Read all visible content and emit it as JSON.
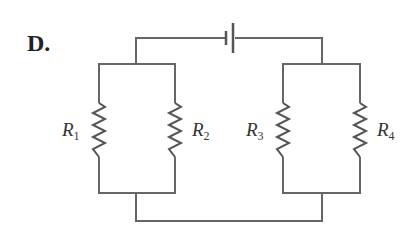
{
  "diagram": {
    "option_label": "D.",
    "type": "circuit",
    "components": {
      "battery": {
        "symbol": "cell",
        "position": "top wire"
      },
      "resistors": [
        {
          "name": "R",
          "sub": "1",
          "group": "left parallel pair"
        },
        {
          "name": "R",
          "sub": "2",
          "group": "left parallel pair"
        },
        {
          "name": "R",
          "sub": "3",
          "group": "right parallel pair"
        },
        {
          "name": "R",
          "sub": "4",
          "group": "right parallel pair"
        }
      ]
    },
    "topology": "Two parallel pairs (R1||R2) and (R3||R4) connected in series with a battery",
    "colors": {
      "wire": "#666666",
      "text": "#222222"
    }
  }
}
